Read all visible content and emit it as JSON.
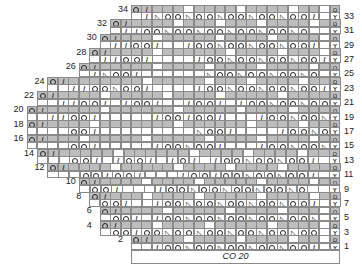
{
  "chart_meta": {
    "title": "Knitting lace chart",
    "cast_on_label": "CO 20",
    "columns": 20,
    "rows": 34
  },
  "geometry": {
    "origin_x": 131,
    "top_y": 5,
    "cell_w": 10.45,
    "cell_h": 7.2
  },
  "legend_symbols": {
    "o": "yarn-over",
    "/": "k2tog",
    "ssk": "ssk (triangle)",
    "cap": "cap/bind symbol (even rows, edge)",
    "y": "slip/y symbol (odd rows, edge)"
  },
  "row_labels": {
    "left": [
      "34",
      "32",
      "30",
      "28",
      "26",
      "24",
      "22",
      "20",
      "18",
      "16",
      "14",
      "12",
      "10",
      "8",
      "6",
      "4",
      "2"
    ],
    "right": [
      "33",
      "31",
      "29",
      "27",
      "25",
      "23",
      "21",
      "19",
      "17",
      "15",
      "13",
      "11",
      "9",
      "7",
      "5",
      "3",
      "1"
    ]
  },
  "rows": [
    {
      "n": 34,
      "start": 0,
      "cells": [
        "o",
        "/",
        "g",
        "g",
        "g",
        "",
        "g",
        "g",
        "g",
        "g",
        "",
        "g",
        "g",
        "g",
        "g",
        "",
        "g",
        "g",
        "",
        "cap"
      ]
    },
    {
      "n": 33,
      "start": 0,
      "cells": [
        "",
        "/",
        "ssk",
        "o",
        "o",
        "ssk",
        "o",
        "o",
        "ssk",
        "o",
        "o",
        "ssk",
        "o",
        "o",
        "ssk",
        "o",
        "o",
        "/",
        "",
        "y"
      ]
    },
    {
      "n": 32,
      "start": -2,
      "cells": [
        "o",
        "/",
        "g",
        "g",
        "g",
        "g",
        "",
        "g",
        "g",
        "g",
        "",
        "g",
        "g",
        "g",
        "",
        "g",
        "g",
        "g",
        "g",
        "",
        "g",
        "cap"
      ]
    },
    {
      "n": 31,
      "start": -2,
      "cells": [
        "",
        "/",
        "/",
        "o",
        "o",
        "ssk",
        "o",
        "o",
        "ssk",
        "o",
        "o",
        "ssk",
        "o",
        "o",
        "ssk",
        "o",
        "o",
        "ssk",
        "o",
        "",
        "",
        "y"
      ]
    },
    {
      "n": 30,
      "start": -3,
      "cells": [
        "o",
        "/",
        "g",
        "g",
        "g",
        "",
        "g",
        "g",
        "g",
        "g",
        "g",
        "",
        "g",
        "g",
        "g",
        "g",
        "",
        "g",
        "g",
        "g",
        "g",
        "",
        "cap"
      ]
    },
    {
      "n": 29,
      "start": -3,
      "cells": [
        "",
        "/",
        "/",
        "o",
        "o",
        "/",
        "",
        "",
        "/",
        "o",
        "o",
        "ssk",
        "o",
        "o",
        "ssk",
        "o",
        "o",
        "ssk",
        "o",
        "o",
        "/",
        "",
        "y"
      ]
    },
    {
      "n": 28,
      "start": -4,
      "cells": [
        "o",
        "/",
        "g",
        "g",
        "g",
        "g",
        "",
        "g",
        "g",
        "g",
        "g",
        "g",
        "g",
        "",
        "g",
        "g",
        "g",
        "g",
        "",
        "g",
        "g",
        "g",
        "",
        "cap"
      ]
    },
    {
      "n": 27,
      "start": -4,
      "cells": [
        "",
        "/",
        "/",
        "o",
        "o",
        "/",
        "",
        "",
        "",
        "",
        "/",
        "o",
        "o",
        "ssk",
        "o",
        "o",
        "ssk",
        "o",
        "o",
        "ssk",
        "o",
        "o",
        "/",
        "y"
      ]
    },
    {
      "n": 26,
      "start": -5,
      "cells": [
        "o",
        "/",
        "g",
        "g",
        "g",
        "g",
        "g",
        "",
        "g",
        "g",
        "g",
        "g",
        "",
        "g",
        "g",
        "g",
        "g",
        "",
        "g",
        "g",
        "g",
        "g",
        "",
        "g",
        "cap"
      ]
    },
    {
      "n": 25,
      "start": -5,
      "cells": [
        "",
        "/",
        "ssk",
        "o",
        "o",
        "/",
        "",
        "",
        "",
        "",
        "",
        "",
        "ssk",
        "o",
        "o",
        "ssk",
        "o",
        "o",
        "ssk",
        "o",
        "o",
        "ssk",
        "o",
        "",
        "y"
      ]
    },
    {
      "n": 24,
      "start": -8,
      "cells": [
        "o",
        "/",
        "g",
        "g",
        "g",
        "g",
        "g",
        "g",
        "g",
        "",
        "g",
        "g",
        "g",
        "g",
        "g",
        "",
        "g",
        "g",
        "g",
        "",
        "g",
        "g",
        "g",
        "g",
        "",
        "g",
        "g",
        "cap"
      ]
    },
    {
      "n": 23,
      "start": -8,
      "cells": [
        "",
        "",
        "/",
        "/",
        "o",
        "o",
        "ssk",
        "o",
        "o",
        "/",
        "",
        "",
        "",
        "",
        "/",
        "o",
        "o",
        "ssk",
        "o",
        "o",
        "ssk",
        "o",
        "o",
        "ssk",
        "o",
        "o",
        "/",
        "y"
      ]
    },
    {
      "n": 22,
      "start": -9,
      "cells": [
        "o",
        "/",
        "g",
        "g",
        "g",
        "g",
        "",
        "g",
        "g",
        "g",
        "g",
        "g",
        "",
        "g",
        "g",
        "g",
        "g",
        "",
        "g",
        "g",
        "g",
        "g",
        "g",
        "",
        "g",
        "g",
        "g",
        "g",
        "cap"
      ]
    },
    {
      "n": 21,
      "start": -9,
      "cells": [
        "",
        "",
        "/",
        "/",
        "o",
        "o",
        "/",
        "",
        "/",
        "o",
        "o",
        "/",
        "",
        "",
        "/",
        "o",
        "o",
        "/",
        "",
        "/",
        "o",
        "o",
        "ssk",
        "o",
        "o",
        "ssk",
        "o",
        "o",
        "y"
      ]
    },
    {
      "n": 20,
      "start": -10,
      "cells": [
        "o",
        "/",
        "g",
        "g",
        "g",
        "g",
        "g",
        "",
        "g",
        "g",
        "g",
        "g",
        "g",
        "g",
        "",
        "g",
        "g",
        "g",
        "g",
        "g",
        "",
        "g",
        "g",
        "g",
        "g",
        "",
        "g",
        "g",
        "g",
        "cap"
      ]
    },
    {
      "n": 19,
      "start": -10,
      "cells": [
        "",
        "",
        "/",
        "/",
        "o",
        "o",
        "/",
        "",
        "",
        "",
        "",
        "",
        "/",
        "o",
        "o",
        "/",
        "o",
        "o",
        "/",
        "",
        "",
        "",
        "/",
        "o",
        "o",
        "ssk",
        "o",
        "o",
        "ssk",
        "y"
      ]
    },
    {
      "n": 18,
      "start": -10,
      "cells": [
        "o",
        "/",
        "g",
        "g",
        "g",
        "g",
        "",
        "g",
        "g",
        "g",
        "g",
        "g",
        "g",
        "g",
        "",
        "g",
        "g",
        "g",
        "g",
        "g",
        "g",
        "",
        "g",
        "g",
        "g",
        "g",
        "",
        "g",
        "g",
        "cap"
      ]
    },
    {
      "n": 17,
      "start": -10,
      "cells": [
        "",
        "",
        "",
        "",
        "o",
        "o",
        "/",
        "",
        "",
        "",
        "",
        "",
        "",
        "",
        "",
        "",
        "ssk",
        "o",
        "o",
        "/",
        "",
        "",
        "",
        "",
        "/",
        "o",
        "o",
        "ssk",
        "o",
        "y"
      ]
    },
    {
      "n": 16,
      "start": -10,
      "cells": [
        "o",
        "/",
        "g",
        "g",
        "g",
        "",
        "g",
        "g",
        "g",
        "g",
        "g",
        "",
        "g",
        "g",
        "g",
        "g",
        "g",
        "",
        "g",
        "g",
        "g",
        "g",
        "",
        "g",
        "g",
        "g",
        "g",
        "",
        "g",
        "cap"
      ]
    },
    {
      "n": 15,
      "start": -10,
      "cells": [
        "",
        "",
        "",
        "",
        "o",
        "o",
        "/",
        "",
        "",
        "",
        "",
        "",
        "/",
        "o",
        "o",
        "ssk",
        "o",
        "o",
        "/",
        "",
        "",
        "",
        "/",
        "o",
        "o",
        "ssk",
        "o",
        "o",
        "ssk",
        "y"
      ]
    },
    {
      "n": 14,
      "start": -9,
      "cells": [
        "o",
        "/",
        "g",
        "g",
        "g",
        "g",
        "g",
        "",
        "g",
        "g",
        "g",
        "g",
        "g",
        "g",
        "",
        "g",
        "g",
        "g",
        "g",
        "",
        "g",
        "g",
        "g",
        "g",
        "",
        "g",
        "g",
        "cap"
      ]
    },
    {
      "n": 13,
      "start": -9,
      "cells": [
        "",
        "",
        "",
        "o",
        "o",
        "/",
        "",
        "/",
        "o",
        "o",
        "/",
        "",
        "/",
        "o",
        "/",
        "",
        "/",
        "o",
        "o",
        "ssk",
        "o",
        "o",
        "ssk",
        "o",
        "o",
        "/",
        "",
        "y"
      ]
    },
    {
      "n": 12,
      "start": -8,
      "cells": [
        "o",
        "/",
        "g",
        "g",
        "g",
        "g",
        "",
        "g",
        "g",
        "g",
        "g",
        "g",
        "",
        "g",
        "g",
        "g",
        "g",
        "",
        "g",
        "g",
        "g",
        "g",
        "",
        "g",
        "g",
        "g",
        "g",
        "cap"
      ]
    },
    {
      "n": 11,
      "start": -8,
      "cells": [
        "",
        "",
        "",
        "o",
        "o",
        "/",
        "o",
        "o",
        "/",
        "",
        "",
        "",
        "/",
        "o",
        "o",
        "/",
        "o",
        "o",
        "ssk",
        "o",
        "o",
        "ssk",
        "o",
        "o",
        "/",
        "",
        "y"
      ]
    },
    {
      "n": 10,
      "start": -5,
      "cells": [
        "o",
        "/",
        "g",
        "g",
        "g",
        "g",
        "",
        "g",
        "g",
        "g",
        "g",
        "",
        "g",
        "g",
        "g",
        "g",
        "g",
        "",
        "g",
        "g",
        "g",
        "g",
        "",
        "g",
        "cap"
      ]
    },
    {
      "n": 9,
      "start": -5,
      "cells": [
        "",
        "o",
        "o",
        "/",
        "",
        "",
        "",
        "/",
        "o",
        "o",
        "ssk",
        "o",
        "o",
        "ssk",
        "o",
        "o",
        "ssk",
        "o",
        "o",
        "ssk",
        "o",
        "",
        "",
        "y"
      ]
    },
    {
      "n": 8,
      "start": -4,
      "cells": [
        "o",
        "/",
        "g",
        "g",
        "g",
        "",
        "g",
        "g",
        "g",
        "g",
        "",
        "g",
        "g",
        "g",
        "g",
        "g",
        "",
        "g",
        "g",
        "g",
        "g",
        "",
        "g",
        "cap"
      ]
    },
    {
      "n": 7,
      "start": -4,
      "cells": [
        "",
        "o",
        "o",
        "/",
        "",
        "",
        "/",
        "o",
        "o",
        "ssk",
        "o",
        "o",
        "ssk",
        "o",
        "o",
        "ssk",
        "o",
        "o",
        "ssk",
        "o",
        "o",
        "/",
        "",
        "y"
      ]
    },
    {
      "n": 6,
      "start": -3,
      "cells": [
        "o",
        "/",
        "g",
        "g",
        "g",
        "g",
        "",
        "g",
        "g",
        "g",
        "g",
        "g",
        "",
        "g",
        "g",
        "g",
        "g",
        "",
        "g",
        "g",
        "g",
        "",
        "cap"
      ]
    },
    {
      "n": 5,
      "start": -3,
      "cells": [
        "",
        "o",
        "o",
        "/",
        "",
        "/",
        "o",
        "o",
        "ssk",
        "o",
        "o",
        "ssk",
        "o",
        "o",
        "ssk",
        "o",
        "o",
        "ssk",
        "o",
        "o",
        "ssk",
        "",
        "y"
      ]
    },
    {
      "n": 4,
      "start": -3,
      "cells": [
        "o",
        "/",
        "g",
        "g",
        "g",
        "",
        "g",
        "g",
        "g",
        "g",
        "",
        "g",
        "g",
        "g",
        "g",
        "g",
        "",
        "g",
        "g",
        "g",
        "g",
        "",
        "cap"
      ]
    },
    {
      "n": 3,
      "start": -3,
      "cells": [
        "",
        "o",
        "o",
        "/",
        "o",
        "o",
        "ssk",
        "o",
        "o",
        "ssk",
        "o",
        "o",
        "ssk",
        "o",
        "o",
        "ssk",
        "o",
        "o",
        "ssk",
        "o",
        "o",
        "",
        "y"
      ]
    },
    {
      "n": 2,
      "start": 0,
      "cells": [
        "o",
        "/",
        "g",
        "g",
        "g",
        "",
        "g",
        "g",
        "g",
        "g",
        "",
        "g",
        "g",
        "g",
        "g",
        "",
        "g",
        "g",
        "",
        "cap"
      ]
    },
    {
      "n": 1,
      "start": 0,
      "cells": [
        "",
        "",
        "/",
        "o",
        "o",
        "ssk",
        "o",
        "o",
        "ssk",
        "o",
        "o",
        "ssk",
        "o",
        "o",
        "ssk",
        "o",
        "o",
        "/",
        "",
        "y"
      ]
    }
  ]
}
